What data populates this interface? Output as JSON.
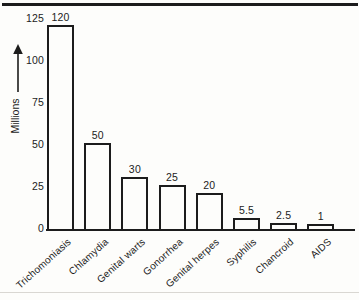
{
  "page": {
    "background": "#fdfdfb",
    "ink_color": "#1c1c1c",
    "faint_rule_color": "#d9d7d2"
  },
  "chart_data": {
    "type": "bar",
    "title": "",
    "xlabel": "",
    "ylabel": "Millions",
    "categories": [
      "Trichomoniasis",
      "Chlamydia",
      "Genital warts",
      "Gonorrhea",
      "Genital herpes",
      "Syphilis",
      "Chancroid",
      "AIDS"
    ],
    "values": [
      120,
      50,
      30,
      25,
      20,
      5.5,
      2.5,
      1
    ],
    "value_labels": [
      "120",
      "50",
      "30",
      "25",
      "20",
      "5.5",
      "2.5",
      "1"
    ],
    "yticks": [
      0,
      25,
      50,
      75,
      100,
      125
    ],
    "ylim": [
      0,
      125
    ],
    "grid": false,
    "legend": "none",
    "bar_style": "outline",
    "bar_fill": "#fdfdfb",
    "bar_outline": "#1c1c1c"
  }
}
